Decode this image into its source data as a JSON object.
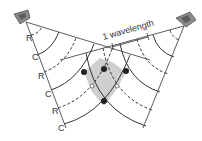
{
  "diagram": {
    "wavelength_label": "1 wavelength",
    "left_labels": [
      "R",
      "C",
      "R",
      "C",
      "R",
      "C"
    ],
    "legend": {
      "R": "rarefaction (dashed)",
      "C": "compression (solid)"
    },
    "colors": {
      "line": "#333333",
      "shaded_region": "#cfcfcf",
      "speaker": "#8a8a8a",
      "node_dot": "#222222"
    },
    "sources": [
      "left-speaker",
      "right-speaker"
    ]
  }
}
